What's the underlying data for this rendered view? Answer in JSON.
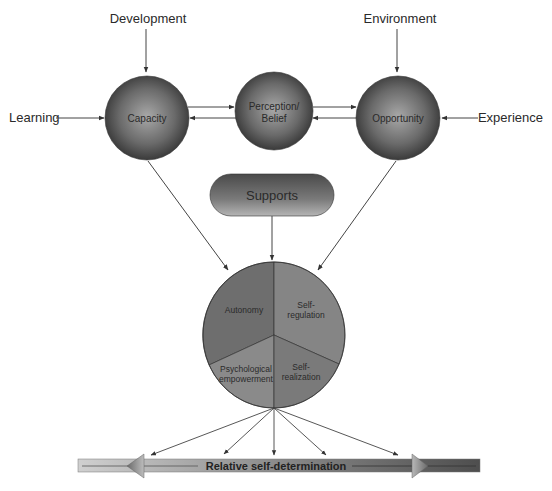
{
  "diagram": {
    "external_inputs": {
      "development": "Development",
      "environment": "Environment",
      "learning": "Learning",
      "experience": "Experience"
    },
    "nodes": {
      "capacity": "Capacity",
      "perception_line1": "Perception/",
      "perception_line2": "Belief",
      "opportunity": "Opportunity"
    },
    "supports": "Supports",
    "pie": {
      "autonomy": "Autonomy",
      "self_regulation_line1": "Self-",
      "self_regulation_line2": "regulation",
      "psych_line1": "Psychological",
      "psych_line2": "empowerment",
      "self_realization_line1": "Self-",
      "self_realization_line2": "realization"
    },
    "continuum": "Relative self-determination"
  },
  "colors": {
    "node_dark": "#3a3a3a",
    "node_light": "#9a9a9a",
    "line": "#444444",
    "bar_light": "#c8c8c8",
    "bar_dark": "#5a5a5a"
  }
}
